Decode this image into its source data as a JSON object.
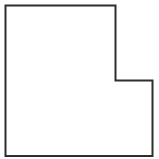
{
  "diagram": {
    "shape": {
      "type": "polygon",
      "points": [
        [
          5.5,
          5.5
        ],
        [
          115.5,
          5.5
        ],
        [
          115.5,
          80.5
        ],
        [
          152.5,
          80.5
        ],
        [
          152.5,
          156
        ],
        [
          5.5,
          156
        ]
      ],
      "points_attr": "5.5,5.5 115.5,5.5 115.5,80.5 152.5,80.5 152.5,156 5.5,156",
      "stroke": "#2e2e2e",
      "stroke_width": "2",
      "fill": "#ffffff"
    },
    "background": "#ffffff"
  }
}
